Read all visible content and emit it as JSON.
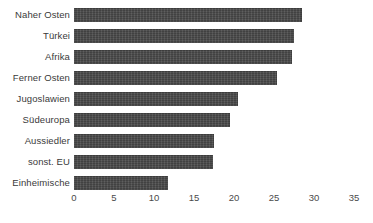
{
  "chart_data": {
    "type": "bar",
    "orientation": "horizontal",
    "title": "",
    "subtitle": "",
    "xlabel": "",
    "ylabel": "",
    "xlim": [
      0,
      35
    ],
    "xticks": [
      0,
      5,
      10,
      15,
      20,
      25,
      30,
      35
    ],
    "xtick_labels": [
      "0",
      "5",
      "10",
      "15",
      "20",
      "25",
      "30",
      "35"
    ],
    "grid": false,
    "legend": null,
    "bar_color": "#494949",
    "background_color": "#ffffff",
    "categories": [
      "Naher Osten",
      "Türkei",
      "Afrika",
      "Ferner Osten",
      "Jugoslawien",
      "Südeuropa",
      "Aussiedler",
      "sonst. EU",
      "Einheimische"
    ],
    "values": [
      28.5,
      27.5,
      27.3,
      25.4,
      20.5,
      19.5,
      17.5,
      17.4,
      11.8
    ]
  }
}
